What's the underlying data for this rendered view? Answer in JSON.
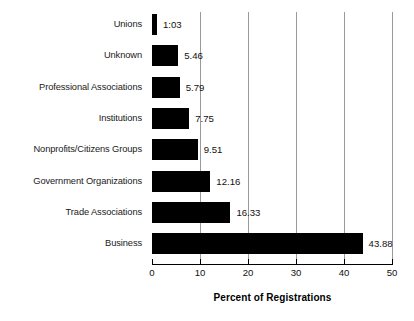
{
  "chart_data": {
    "type": "bar",
    "orientation": "horizontal",
    "title": "",
    "xlabel": "Percent of Registrations",
    "ylabel": "",
    "xlim": [
      0,
      50
    ],
    "xticks": [
      0,
      10,
      20,
      30,
      40,
      50
    ],
    "xtick_labels": [
      "0",
      "10",
      "20",
      "30",
      "40",
      "50"
    ],
    "grid": "vertical",
    "legend": "none",
    "categories": [
      "Unions",
      "Unknown",
      "Professional Associations",
      "Institutions",
      "Nonprofits/Citizens Groups",
      "Government Organizations",
      "Trade Associations",
      "Business"
    ],
    "values": [
      1.03,
      5.46,
      5.79,
      7.75,
      9.51,
      12.16,
      16.33,
      43.88
    ],
    "data_labels": [
      "1:03",
      "5.46",
      "5.79",
      "7.75",
      "9.51",
      "12.16",
      "16.33",
      "43.88"
    ],
    "bar_color": "#000000",
    "background_color": "#ffffff",
    "gridline_color": "#9a9a9a"
  },
  "axis": {
    "title": "Percent of Registrations"
  }
}
